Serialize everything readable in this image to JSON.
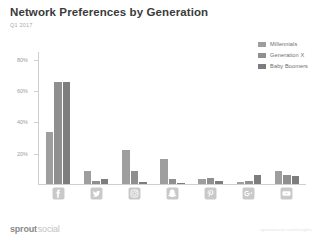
{
  "header": {
    "title": "Network Preferences by Generation",
    "subtitle": "Q1 2017"
  },
  "legend": {
    "items": [
      {
        "label": "Millennials",
        "color": "#9e9e9e"
      },
      {
        "label": "Generation X",
        "color": "#8f8f8f"
      },
      {
        "label": "Baby Boomers",
        "color": "#7d7d7d"
      }
    ]
  },
  "axis": {
    "y_ticks": [
      "80%",
      "60%",
      "40%",
      "20%"
    ]
  },
  "footer": {
    "brand_primary": "sprout",
    "brand_secondary": "social",
    "source_note": "sproutsocial.com/insights"
  },
  "icons": [
    {
      "name": "facebook-icon",
      "label": "Facebook"
    },
    {
      "name": "twitter-icon",
      "label": "Twitter"
    },
    {
      "name": "instagram-icon",
      "label": "Instagram"
    },
    {
      "name": "snapchat-icon",
      "label": "Snapchat"
    },
    {
      "name": "pinterest-icon",
      "label": "Pinterest"
    },
    {
      "name": "googleplus-icon",
      "label": "Google+"
    },
    {
      "name": "youtube-icon",
      "label": "YouTube"
    }
  ],
  "chart_data": {
    "type": "bar",
    "title": "Network Preferences by Generation",
    "subtitle": "Q1 2017",
    "xlabel": "",
    "ylabel": "",
    "ylim": [
      0,
      85
    ],
    "grid": false,
    "legend_position": "top-right",
    "categories": [
      "Facebook",
      "Twitter",
      "Instagram",
      "Snapchat",
      "Pinterest",
      "Google+",
      "YouTube"
    ],
    "ytick_values": [
      20,
      40,
      60,
      80
    ],
    "ytick_labels": [
      "20%",
      "40%",
      "60%",
      "80%"
    ],
    "series": [
      {
        "name": "Millennials",
        "color": "#9e9e9e",
        "values": [
          33,
          8,
          22,
          16,
          3,
          1,
          8
        ]
      },
      {
        "name": "Generation X",
        "color": "#8f8f8f",
        "values": [
          65,
          2,
          8,
          3,
          4,
          2,
          6
        ]
      },
      {
        "name": "Baby Boomers",
        "color": "#7d7d7d",
        "values": [
          65,
          3,
          1,
          0.5,
          2,
          6,
          5
        ]
      }
    ]
  }
}
